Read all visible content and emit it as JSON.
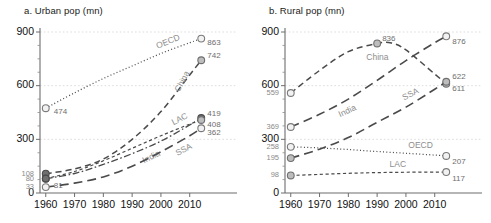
{
  "figure": {
    "panel_a_title": "a. Urban pop (mn)",
    "panel_b_title": "b. Rural pop (mn)"
  },
  "chart_data": [
    {
      "type": "line",
      "title": "a. Urban pop (mn)",
      "xlabel": "",
      "ylabel": "",
      "xlim": [
        1958,
        2016
      ],
      "ylim": [
        0,
        900
      ],
      "grid": true,
      "legend": "inline-labels",
      "xticks": [
        1960,
        1970,
        1980,
        1990,
        2000,
        2010
      ],
      "yticks": [
        0,
        300,
        600,
        900
      ],
      "y_extra_ticks": [
        33,
        80,
        108
      ],
      "annotations": [
        "474",
        "108",
        "80",
        "33",
        "81",
        "863",
        "742",
        "419",
        "408",
        "362"
      ],
      "series": [
        {
          "name": "OECD",
          "style": "dotted",
          "marker_start": "open",
          "marker_end": "open",
          "start_label": "474",
          "end_label": "863",
          "x": [
            1960,
            1970,
            1980,
            1990,
            2000,
            2010,
            2014
          ],
          "values": [
            474,
            560,
            640,
            710,
            780,
            840,
            863
          ]
        },
        {
          "name": "China",
          "style": "dashed",
          "marker_start": "filled",
          "marker_end": "half",
          "start_label": "108",
          "end_label": "742",
          "x": [
            1960,
            1970,
            1980,
            1990,
            2000,
            2010,
            2014
          ],
          "values": [
            108,
            135,
            190,
            300,
            455,
            660,
            742
          ]
        },
        {
          "name": "India",
          "style": "dashdot",
          "marker_start": "filled",
          "marker_end": "filled",
          "start_label": "80",
          "end_label": "419",
          "x": [
            1960,
            1970,
            1980,
            1990,
            2000,
            2010,
            2014
          ],
          "values": [
            80,
            109,
            160,
            220,
            290,
            380,
            419
          ]
        },
        {
          "name": "LAC",
          "style": "shortdash",
          "marker_start": "filled",
          "marker_end": "half",
          "start_label": "81",
          "end_label": "408",
          "x": [
            1960,
            1970,
            1980,
            1990,
            2000,
            2010,
            2014
          ],
          "values": [
            81,
            120,
            180,
            250,
            320,
            385,
            408
          ]
        },
        {
          "name": "SSA",
          "style": "longdash",
          "marker_start": "open",
          "marker_end": "open",
          "start_label": "33",
          "end_label": "362",
          "x": [
            1960,
            1970,
            1980,
            1990,
            2000,
            2010,
            2014
          ],
          "values": [
            33,
            55,
            90,
            150,
            230,
            320,
            362
          ]
        }
      ]
    },
    {
      "type": "line",
      "title": "b. Rural pop (mn)",
      "xlabel": "",
      "ylabel": "",
      "xlim": [
        1958,
        2016
      ],
      "ylim": [
        0,
        900
      ],
      "grid": true,
      "legend": "inline-labels",
      "xticks": [
        1960,
        1970,
        1980,
        1990,
        2000,
        2010
      ],
      "yticks": [
        0,
        300,
        600,
        900
      ],
      "y_extra_ticks": [
        98,
        195,
        258,
        369,
        559
      ],
      "annotations": [
        "559",
        "369",
        "258",
        "195",
        "98",
        "836",
        "876",
        "622",
        "611",
        "207",
        "117"
      ],
      "series": [
        {
          "name": "China",
          "style": "dashed",
          "marker_start": "open",
          "marker_mid": "half",
          "marker_end": "half",
          "start_label": "559",
          "mid_label": "836",
          "end_label": "611",
          "x": [
            1960,
            1970,
            1980,
            1990,
            1995,
            2000,
            2010,
            2014
          ],
          "values": [
            559,
            685,
            790,
            836,
            838,
            800,
            665,
            611
          ]
        },
        {
          "name": "India",
          "style": "longdash",
          "marker_start": "open",
          "marker_end": "open",
          "start_label": "369",
          "end_label": "876",
          "x": [
            1960,
            1970,
            1980,
            1990,
            2000,
            2010,
            2014
          ],
          "values": [
            369,
            440,
            525,
            630,
            740,
            840,
            876
          ]
        },
        {
          "name": "SSA",
          "style": "longdash",
          "marker_start": "half",
          "marker_end": "half",
          "start_label": "195",
          "end_label": "622",
          "x": [
            1960,
            1970,
            1980,
            1990,
            2000,
            2010,
            2014
          ],
          "values": [
            195,
            245,
            310,
            395,
            480,
            580,
            622
          ]
        },
        {
          "name": "OECD",
          "style": "dotted",
          "marker_start": "open",
          "marker_end": "open",
          "start_label": "258",
          "end_label": "207",
          "x": [
            1960,
            1970,
            1980,
            1990,
            2000,
            2010,
            2014
          ],
          "values": [
            258,
            252,
            243,
            232,
            222,
            212,
            207
          ]
        },
        {
          "name": "LAC",
          "style": "shortdash",
          "marker_start": "half",
          "marker_end": "open",
          "start_label": "98",
          "end_label": "117",
          "x": [
            1960,
            1970,
            1980,
            1990,
            2000,
            2010,
            2014
          ],
          "values": [
            98,
            104,
            110,
            114,
            116,
            117,
            117
          ]
        }
      ]
    }
  ]
}
